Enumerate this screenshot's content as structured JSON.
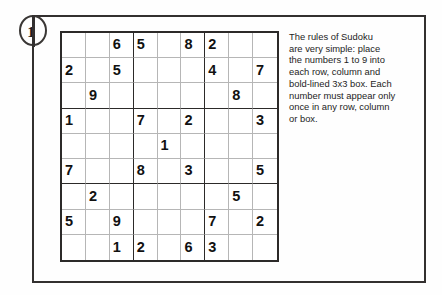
{
  "puzzle": {
    "number": "1",
    "badge_icon": "circled-number-badge"
  },
  "rules": {
    "lines": [
      "The rules of Sudoku",
      "are very simple: place",
      "the numbers 1 to 9 into",
      "each row, column and",
      "bold-lined 3x3 box. Each",
      "number must appear only",
      "once in any row, column",
      "or box."
    ],
    "full_text": "The rules of Sudoku are very simple: place the numbers 1 to 9 into each row, column and bold-lined 3x3 box. Each number must appear only once in any row, column or box."
  },
  "colors": {
    "frame": "#33302f",
    "grid_bold": "#2c2a29",
    "grid_thin": "#b6b6b6",
    "digit": "#111111",
    "background": "#fefefe"
  },
  "grid": {
    "size": 9,
    "box_size": 3,
    "rows": [
      [
        "",
        "",
        "6",
        "5",
        "",
        "8",
        "2",
        "",
        ""
      ],
      [
        "2",
        "",
        "5",
        "",
        "",
        "",
        "4",
        "",
        "7"
      ],
      [
        "",
        "9",
        "",
        "",
        "",
        "",
        "",
        "8",
        ""
      ],
      [
        "1",
        "",
        "",
        "7",
        "",
        "2",
        "",
        "",
        "3"
      ],
      [
        "",
        "",
        "",
        "",
        "1",
        "",
        "",
        "",
        ""
      ],
      [
        "7",
        "",
        "",
        "8",
        "",
        "3",
        "",
        "",
        "5"
      ],
      [
        "",
        "2",
        "",
        "",
        "",
        "",
        "",
        "5",
        ""
      ],
      [
        "5",
        "",
        "9",
        "",
        "",
        "",
        "7",
        "",
        "2"
      ],
      [
        "",
        "",
        "1",
        "2",
        "",
        "6",
        "3",
        "",
        ""
      ]
    ]
  }
}
